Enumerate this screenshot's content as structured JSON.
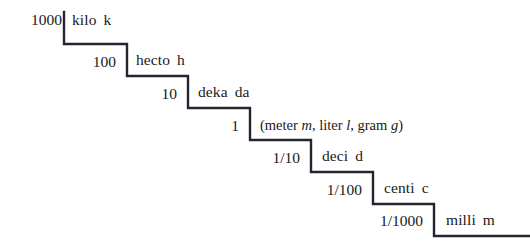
{
  "diagram": {
    "type": "staircase",
    "background_color": "#ffffff",
    "stroke_color": "#262430",
    "stroke_width": 2.4,
    "text_color": "#1a1a1a",
    "steps": [
      {
        "value": "1000",
        "prefix_name": "kilo",
        "prefix_symbol": "k",
        "riser_x": 64,
        "riser_top_y": 12,
        "riser_bottom_y": 44,
        "tread_end_x": 127
      },
      {
        "value": "100",
        "prefix_name": "hecto",
        "prefix_symbol": "h",
        "riser_x": 127,
        "riser_top_y": 44,
        "riser_bottom_y": 76,
        "tread_end_x": 188
      },
      {
        "value": "10",
        "prefix_name": "deka",
        "prefix_symbol": "da",
        "riser_x": 188,
        "riser_top_y": 76,
        "riser_bottom_y": 108,
        "tread_end_x": 250
      },
      {
        "value": "1",
        "prefix_name": "",
        "prefix_symbol": "",
        "riser_x": 250,
        "riser_top_y": 108,
        "riser_bottom_y": 140,
        "tread_end_x": 311
      },
      {
        "value": "1/10",
        "prefix_name": "deci",
        "prefix_symbol": "d",
        "riser_x": 311,
        "riser_top_y": 140,
        "riser_bottom_y": 172,
        "tread_end_x": 373
      },
      {
        "value": "1/100",
        "prefix_name": "centi",
        "prefix_symbol": "c",
        "riser_x": 373,
        "riser_top_y": 172,
        "riser_bottom_y": 204,
        "tread_end_x": 434
      },
      {
        "value": "1/1000",
        "prefix_name": "milli",
        "prefix_symbol": "m",
        "riser_x": 434,
        "riser_top_y": 204,
        "riser_bottom_y": 236,
        "tread_end_x": 530
      }
    ],
    "base_unit": {
      "open_paren": "(",
      "unit_1_name": "meter",
      "unit_1_symbol": "m",
      "sep_1": ", ",
      "unit_2_name": "liter",
      "unit_2_symbol": "l",
      "sep_2": ", ",
      "unit_3_name": "gram",
      "unit_3_symbol": "g",
      "close_paren": ")"
    }
  }
}
